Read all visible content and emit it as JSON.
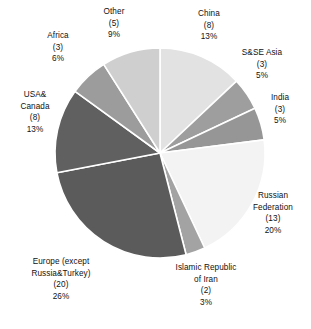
{
  "chart_data": {
    "type": "pie",
    "title": "",
    "subtitle": "",
    "legend_position": "none",
    "grid": false,
    "labels_show_count": true,
    "labels_show_percent": true,
    "start_angle_deg": 0,
    "direction": "clockwise",
    "categories": [
      "China",
      "S&SE Asia",
      "India",
      "Russian Federation",
      "Islamic Republic of Iran",
      "Europe (except Russia&Turkey)",
      "USA& Canada",
      "Africa",
      "Other"
    ],
    "values": [
      13,
      5,
      5,
      20,
      3,
      26,
      13,
      6,
      9
    ],
    "counts": [
      8,
      3,
      3,
      13,
      2,
      20,
      8,
      3,
      5
    ],
    "total_count": 65,
    "slices": [
      {
        "key": "china",
        "name_lines": [
          "China"
        ],
        "count_label": "(8)",
        "percent_label": "13%",
        "value": 13,
        "count": 8,
        "color": "#e2e2e2"
      },
      {
        "key": "ssea",
        "name_lines": [
          "S&SE Asia"
        ],
        "count_label": "(3)",
        "percent_label": "5%",
        "value": 5,
        "count": 3,
        "color": "#9e9e9e"
      },
      {
        "key": "india",
        "name_lines": [
          "India"
        ],
        "count_label": "(3)",
        "percent_label": "5%",
        "value": 5,
        "count": 3,
        "color": "#969696"
      },
      {
        "key": "russia",
        "name_lines": [
          "Russian",
          "Federation"
        ],
        "count_label": "(13)",
        "percent_label": "20%",
        "value": 20,
        "count": 13,
        "color": "#f3f3f3"
      },
      {
        "key": "iran",
        "name_lines": [
          "Islamic Republic",
          "of Iran"
        ],
        "count_label": "(2)",
        "percent_label": "3%",
        "value": 3,
        "count": 2,
        "color": "#a3a3a3"
      },
      {
        "key": "europe",
        "name_lines": [
          "Europe (except",
          "Russia&Turkey)"
        ],
        "count_label": "(20)",
        "percent_label": "26%",
        "value": 26,
        "count": 20,
        "color": "#5b5b5b"
      },
      {
        "key": "usa",
        "name_lines": [
          "USA&",
          "Canada"
        ],
        "count_label": "(8)",
        "percent_label": "13%",
        "value": 13,
        "count": 8,
        "color": "#606060"
      },
      {
        "key": "africa",
        "name_lines": [
          "Africa"
        ],
        "count_label": "(3)",
        "percent_label": "6%",
        "value": 6,
        "count": 3,
        "color": "#9c9c9c"
      },
      {
        "key": "other",
        "name_lines": [
          "Other"
        ],
        "count_label": "(5)",
        "percent_label": "9%",
        "value": 9,
        "count": 5,
        "color": "#cfcfcf"
      }
    ],
    "geometry": {
      "cx": 160,
      "cy": 153,
      "r": 105,
      "separator_color": "#ffffff",
      "separator_width": 1.6
    }
  },
  "labels": {
    "other": {
      "l1": "Other",
      "l2": "",
      "count": "(5)",
      "pct": "9%"
    },
    "china": {
      "l1": "China",
      "l2": "",
      "count": "(8)",
      "pct": "13%"
    },
    "sasia": {
      "l1": "S&SE Asia",
      "l2": "",
      "count": "(3)",
      "pct": "5%"
    },
    "india": {
      "l1": "India",
      "l2": "",
      "count": "(3)",
      "pct": "5%"
    },
    "russia": {
      "l1": "Russian",
      "l2": "Federation",
      "count": "(13)",
      "pct": "20%"
    },
    "iran": {
      "l1": "Islamic Republic",
      "l2": "of Iran",
      "count": "(2)",
      "pct": "3%"
    },
    "europe": {
      "l1": "Europe (except",
      "l2": "Russia&Turkey)",
      "count": "(20)",
      "pct": "26%"
    },
    "usa": {
      "l1": "USA&",
      "l2": "Canada",
      "count": "(8)",
      "pct": "13%"
    },
    "africa": {
      "l1": "Africa",
      "l2": "",
      "count": "(3)",
      "pct": "6%"
    }
  }
}
